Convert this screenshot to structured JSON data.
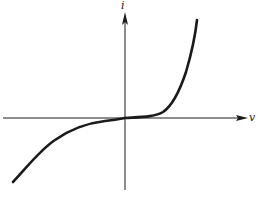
{
  "diagram": {
    "type": "i-v characteristic curve",
    "x_axis": {
      "label": "v",
      "direction": "right"
    },
    "y_axis": {
      "label": "i",
      "direction": "up"
    },
    "colors": {
      "background": "#ffffff",
      "stroke": "#1a1a1a"
    },
    "curve": {
      "description": "Nonlinear curve passing through the origin; flat near origin, rising steeply for positive v and descending for negative v",
      "points": [
        [
          13,
          182
        ],
        [
          40,
          150
        ],
        [
          70,
          130
        ],
        [
          95,
          122
        ],
        [
          125,
          118
        ],
        [
          150,
          116
        ],
        [
          165,
          110
        ],
        [
          178,
          90
        ],
        [
          190,
          55
        ],
        [
          197,
          20
        ]
      ]
    }
  }
}
